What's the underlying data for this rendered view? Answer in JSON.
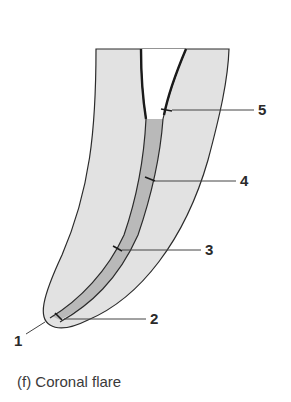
{
  "figure": {
    "caption": "(f) Coronal flare",
    "colors": {
      "dentin": "#e2e2e2",
      "canal_prepared": "#b9b9b9",
      "outline": "#2b2b2b",
      "leader": "#444444",
      "label": "#2a2a2a"
    },
    "labels": [
      {
        "id": "1",
        "text": "1"
      },
      {
        "id": "2",
        "text": "2"
      },
      {
        "id": "3",
        "text": "3"
      },
      {
        "id": "4",
        "text": "4"
      },
      {
        "id": "5",
        "text": "5"
      }
    ]
  }
}
